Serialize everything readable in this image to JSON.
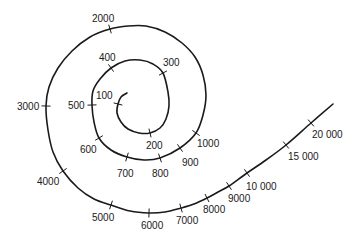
{
  "diagram": {
    "type": "logarithmic-spiral-scale",
    "line_color": "#1a1a1a",
    "background": "#ffffff",
    "markers": [
      {
        "value": 100,
        "label": "100"
      },
      {
        "value": 200,
        "label": "200"
      },
      {
        "value": 300,
        "label": "300"
      },
      {
        "value": 400,
        "label": "400"
      },
      {
        "value": 500,
        "label": "500"
      },
      {
        "value": 600,
        "label": "600"
      },
      {
        "value": 700,
        "label": "700"
      },
      {
        "value": 800,
        "label": "800"
      },
      {
        "value": 900,
        "label": "900"
      },
      {
        "value": 1000,
        "label": "1000"
      },
      {
        "value": 2000,
        "label": "2000"
      },
      {
        "value": 3000,
        "label": "3000"
      },
      {
        "value": 4000,
        "label": "4000"
      },
      {
        "value": 5000,
        "label": "5000"
      },
      {
        "value": 6000,
        "label": "6000"
      },
      {
        "value": 7000,
        "label": "7000"
      },
      {
        "value": 8000,
        "label": "8000"
      },
      {
        "value": 9000,
        "label": "9000"
      },
      {
        "value": 10000,
        "label": "10 000"
      },
      {
        "value": 15000,
        "label": "15 000"
      },
      {
        "value": 20000,
        "label": "20 000"
      }
    ]
  }
}
